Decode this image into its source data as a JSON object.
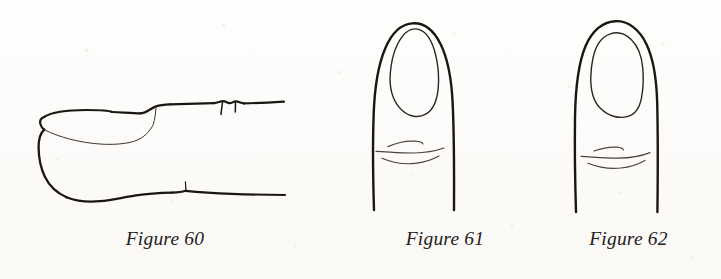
{
  "page": {
    "kind": "book-scan-page",
    "background_color": "#fdfdfc",
    "ink_color": "#1a1614",
    "width": 721,
    "height": 279
  },
  "figures": [
    {
      "id": "figure-60",
      "caption": "Figure 60",
      "subject": "fingernail side profile view",
      "view": "lateral",
      "description": "Side profile of a fingertip showing the nail plate curving over the tip, the free edge, the fleshy pad underneath and the knuckle crease lines along the upper and lower contours.",
      "parts": [
        "nail-plate-outline",
        "nail-free-edge",
        "finger-pad-underside",
        "upper-knuckle-crease",
        "lower-knuckle-crease"
      ]
    },
    {
      "id": "figure-61",
      "caption": "Figure 61",
      "subject": "fingernail front view, narrow oval nail",
      "view": "dorsal",
      "description": "Front view of a finger with a tapered tip and a long narrow oval nail, with two light knuckle crease lines below.",
      "parts": [
        "finger-outline",
        "nail-oval-outline",
        "knuckle-crease-upper",
        "knuckle-crease-lower"
      ]
    },
    {
      "id": "figure-62",
      "caption": "Figure 62",
      "subject": "fingernail front view, wide squarish nail",
      "view": "dorsal",
      "description": "Front view of a finger with a blunter, broader tip and a wide squarish nail with rounded corners, with two light knuckle crease lines below.",
      "parts": [
        "finger-outline",
        "nail-squarish-outline",
        "knuckle-crease-upper",
        "knuckle-crease-lower"
      ]
    }
  ]
}
